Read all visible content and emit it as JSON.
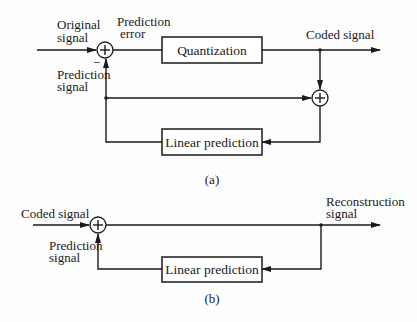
{
  "diagram_a": {
    "caption": "(a)",
    "labels": {
      "original_signal_1": "Original",
      "original_signal_2": "signal",
      "prediction_error_1": "Prediction",
      "prediction_error_2": "error",
      "prediction_signal_1": "Prediction",
      "prediction_signal_2": "signal",
      "coded_signal": "Coded signal",
      "minus_sign": "−"
    },
    "blocks": {
      "quantization": "Quantization",
      "linear_prediction": "Linear prediction"
    },
    "summing_junctions": [
      "+",
      "+"
    ]
  },
  "diagram_b": {
    "caption": "(b)",
    "labels": {
      "coded_signal": "Coded signal",
      "prediction_signal_1": "Prediction",
      "prediction_signal_2": "signal",
      "reconstruction_signal_1": "Reconstruction",
      "reconstruction_signal_2": "signal"
    },
    "blocks": {
      "linear_prediction": "Linear prediction"
    },
    "summing_junctions": [
      "+"
    ]
  }
}
